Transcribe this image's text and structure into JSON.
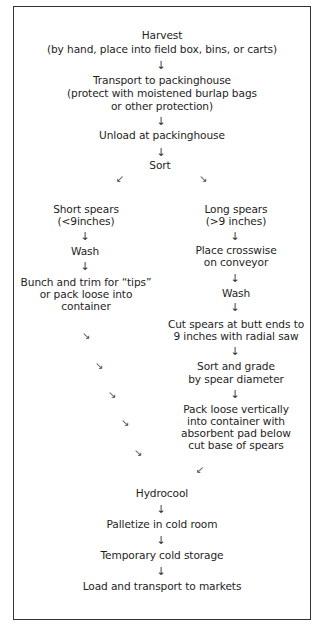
{
  "diagram": {
    "type": "flowchart",
    "top_steps": [
      {
        "lines": [
          "Harvest",
          "(by hand, place into field box, bins, or carts)"
        ]
      },
      {
        "lines": [
          "Transport to packinghouse",
          "(protect with moistened burlap bags",
          "or other protection)"
        ]
      },
      {
        "lines": [
          "Unload at packinghouse"
        ]
      },
      {
        "lines": [
          "Sort"
        ]
      }
    ],
    "left_branch": [
      {
        "lines": [
          "Short spears",
          "(<9inches)"
        ]
      },
      {
        "lines": [
          "Wash"
        ]
      },
      {
        "lines": [
          "Bunch and trim for “tips”",
          "or pack loose into",
          "container"
        ]
      }
    ],
    "right_branch": [
      {
        "lines": [
          "Long spears",
          "(>9 inches)"
        ]
      },
      {
        "lines": [
          "Place crosswise",
          "on conveyor"
        ]
      },
      {
        "lines": [
          "Wash"
        ]
      },
      {
        "lines": [
          "Cut spears at butt ends to",
          "9 inches with radial saw"
        ]
      },
      {
        "lines": [
          "Sort and grade",
          "by spear diameter"
        ]
      },
      {
        "lines": [
          "Pack loose vertically",
          "into container with",
          "absorbent pad below",
          "cut base of spears"
        ]
      }
    ],
    "bottom_steps": [
      {
        "lines": [
          "Hydrocool"
        ]
      },
      {
        "lines": [
          "Palletize in cold room"
        ]
      },
      {
        "lines": [
          "Temporary cold storage"
        ]
      },
      {
        "lines": [
          "Load and transport to markets"
        ]
      }
    ],
    "arrows": {
      "down": "↓",
      "down_left": "↙",
      "down_right": "↘"
    }
  }
}
